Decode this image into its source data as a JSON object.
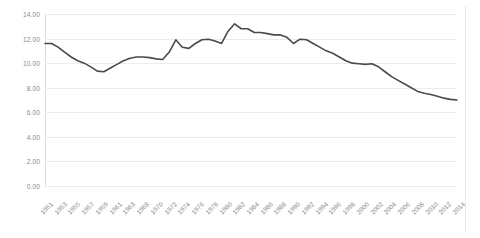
{
  "chart_data": {
    "type": "line",
    "title": "",
    "subtitle": "",
    "xlabel": "",
    "ylabel": "",
    "ylim": [
      0.0,
      14.0
    ],
    "ytick_step": 2.0,
    "ytick_labels": [
      "14.00",
      "12.00",
      "10.00",
      "8.00",
      "6.00",
      "4.00",
      "2.00",
      "0.00"
    ],
    "ytick_values": [
      14.0,
      12.0,
      10.0,
      8.0,
      6.0,
      4.0,
      2.0,
      0.0
    ],
    "xlim": [
      1951,
      2014
    ],
    "xtick_labels": [
      "1951",
      "1953",
      "1955",
      "1957",
      "1959",
      "1961",
      "1963",
      "1968",
      "1970",
      "1972",
      "1974",
      "1976",
      "1978",
      "1980",
      "1982",
      "1984",
      "1986",
      "1988",
      "1990",
      "1992",
      "1994",
      "1996",
      "1998",
      "2000",
      "2002",
      "2004",
      "2006",
      "2008",
      "2010",
      "2012",
      "2014"
    ],
    "xtick_label_rotation": -45,
    "grid": true,
    "grid_axis": "y",
    "legend": false,
    "legend_position": "none",
    "line_color": "#4a4a4a",
    "grid_color": "#ececec",
    "axis_color": "#dcdcdc",
    "tick_label_color": "#8a8a8a",
    "series": [
      {
        "name": "series-1",
        "x": [
          1951,
          1952,
          1953,
          1954,
          1955,
          1956,
          1957,
          1958,
          1959,
          1960,
          1961,
          1962,
          1963,
          1964,
          1965,
          1966,
          1967,
          1968,
          1969,
          1970,
          1971,
          1972,
          1973,
          1974,
          1975,
          1976,
          1977,
          1978,
          1979,
          1980,
          1981,
          1982,
          1983,
          1984,
          1985,
          1986,
          1987,
          1988,
          1989,
          1990,
          1991,
          1992,
          1993,
          1994,
          1995,
          1996,
          1997,
          1998,
          1999,
          2000,
          2001,
          2002,
          2003,
          2004,
          2005,
          2006,
          2007,
          2008,
          2009,
          2010,
          2011,
          2012,
          2013,
          2014
        ],
        "values": [
          11.6,
          11.6,
          11.3,
          10.9,
          10.5,
          10.2,
          10.0,
          9.7,
          9.35,
          9.3,
          9.6,
          9.9,
          10.2,
          10.4,
          10.5,
          10.5,
          10.45,
          10.35,
          10.3,
          10.9,
          11.9,
          11.3,
          11.2,
          11.6,
          11.9,
          11.95,
          11.8,
          11.6,
          12.6,
          13.2,
          12.8,
          12.8,
          12.5,
          12.5,
          12.4,
          12.3,
          12.3,
          12.1,
          11.6,
          11.95,
          11.9,
          11.6,
          11.3,
          11.0,
          10.8,
          10.5,
          10.2,
          10.0,
          9.95,
          9.9,
          9.95,
          9.7,
          9.3,
          8.9,
          8.6,
          8.3,
          8.0,
          7.7,
          7.55,
          7.45,
          7.3,
          7.15,
          7.05,
          7.0
        ]
      }
    ]
  }
}
